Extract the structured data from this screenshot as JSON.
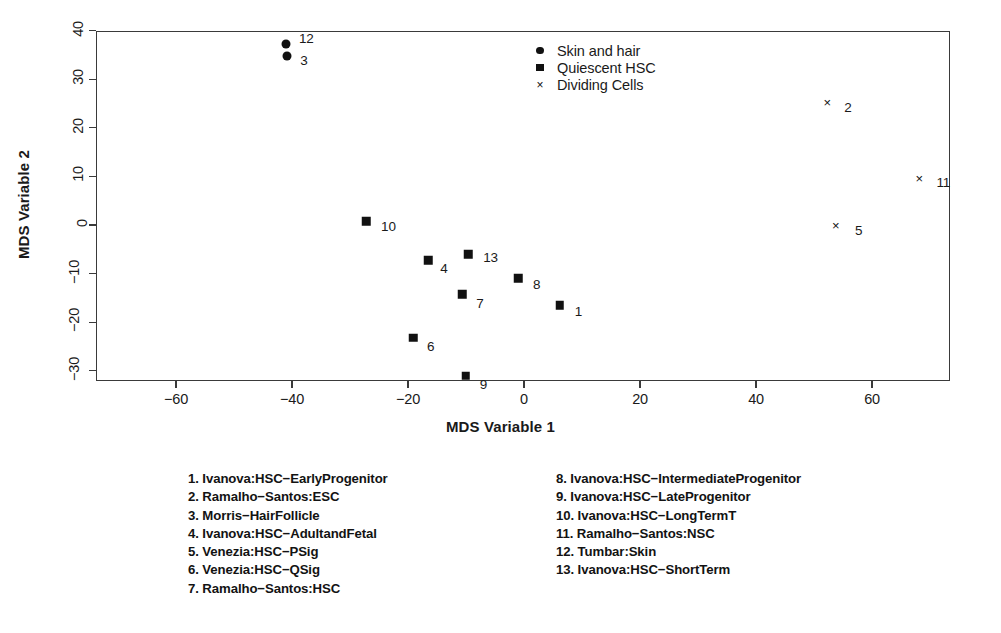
{
  "chart_data": {
    "type": "scatter",
    "title": "",
    "xlabel": "MDS Variable 1",
    "ylabel": "MDS Variable 2",
    "xlim": [
      -72,
      74
    ],
    "ylim": [
      -32,
      41
    ],
    "xticks": [
      -60,
      -40,
      -20,
      0,
      20,
      40,
      60
    ],
    "yticks": [
      40,
      30,
      20,
      10,
      0,
      -10,
      -20,
      -30
    ],
    "xticklabels": [
      "-60",
      "-40",
      "-20",
      "0",
      "20",
      "40",
      "60"
    ],
    "yticklabels": [
      "40",
      "30",
      "20",
      "10",
      "0",
      "-10",
      "-20",
      "-30"
    ],
    "grid": false,
    "legend_position": "top-center",
    "series": [
      {
        "name": "Skin and hair",
        "marker": "circle",
        "points": [
          {
            "label": "12",
            "x": -41.2,
            "y": 37.5,
            "label_dx": 13,
            "label_dy": -5
          },
          {
            "label": "3",
            "x": -41.0,
            "y": 35.0,
            "label_dx": 13,
            "label_dy": 5
          }
        ]
      },
      {
        "name": "Quiescent HSC",
        "marker": "square",
        "points": [
          {
            "label": "10",
            "x": -27.4,
            "y": 1.0,
            "label_dx": 15,
            "label_dy": 6
          },
          {
            "label": "4",
            "x": -16.7,
            "y": -7.0,
            "label_dx": 12,
            "label_dy": 9
          },
          {
            "label": "13",
            "x": -9.8,
            "y": -5.8,
            "label_dx": 15,
            "label_dy": 4
          },
          {
            "label": "8",
            "x": -1.2,
            "y": -10.7,
            "label_dx": 15,
            "label_dy": 7
          },
          {
            "label": "1",
            "x": 6.0,
            "y": -16.3,
            "label_dx": 15,
            "label_dy": 7
          },
          {
            "label": "7",
            "x": -10.8,
            "y": -14.0,
            "label_dx": 14,
            "label_dy": 10
          },
          {
            "label": "6",
            "x": -19.3,
            "y": -23.0,
            "label_dx": 14,
            "label_dy": 9
          },
          {
            "label": "9",
            "x": -10.2,
            "y": -30.8,
            "label_dx": 14,
            "label_dy": 9
          }
        ]
      },
      {
        "name": "Dividing Cells",
        "marker": "cross",
        "points": [
          {
            "label": "2",
            "x": 52.1,
            "y": 25.5,
            "label_dx": 17,
            "label_dy": 6
          },
          {
            "label": "11",
            "x": 68.0,
            "y": 9.8,
            "label_dx": 17,
            "label_dy": 5
          },
          {
            "label": "5",
            "x": 53.6,
            "y": 0.3,
            "label_dx": 19,
            "label_dy": 6
          }
        ]
      }
    ]
  },
  "legend": {
    "entries": [
      {
        "symbol": "circle",
        "label": "Skin and hair"
      },
      {
        "symbol": "square",
        "label": "Quiescent HSC"
      },
      {
        "symbol": "cross",
        "label": "Dividing Cells"
      }
    ]
  },
  "key_list": {
    "left_column": [
      "1. Ivanova:HSC-EarlyProgenitor",
      "2. Ramalho-Santos:ESC",
      "3. Morris-HairFollicle",
      "4. Ivanova:HSC-AdultandFetal",
      "5. Venezia:HSC-PSig",
      "6. Venezia:HSC-QSig",
      "7. Ramalho-Santos:HSC"
    ],
    "right_column": [
      "8. Ivanova:HSC-IntermediateProgenitor",
      "9. Ivanova:HSC-LateProgenitor",
      "10. Ivanova:HSC-LongTermT",
      "11. Ramalho-Santos:NSC",
      "12. Tumbar:Skin",
      "13. Ivanova:HSC-ShortTerm"
    ]
  },
  "colors": {
    "marker": "#111111",
    "axis": "#3a3a3a",
    "text": "#1a1a1a",
    "background": "#ffffff"
  }
}
